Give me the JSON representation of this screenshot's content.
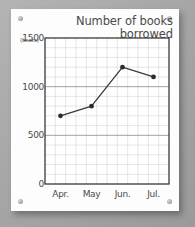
{
  "poster": {
    "corner_screws": [
      "screw-top-left",
      "screw-top-right",
      "screw-bottom-left",
      "screw-bottom-right"
    ]
  },
  "chart_data": {
    "type": "line",
    "title": "Number of books borrowed in Shool A",
    "title_line_1": "Number of books borrowed",
    "title_line_2": "in Shool A",
    "categories": [
      "Apr.",
      "May",
      "Jun.",
      "Jul."
    ],
    "values": [
      700,
      800,
      1200,
      1100
    ],
    "series": [
      {
        "name": "Books borrowed",
        "values": [
          700,
          800,
          1200,
          1100
        ]
      }
    ],
    "xlabel": "",
    "ylabel": "(books)",
    "y_unit": "(books)",
    "ylim": [
      0,
      1500
    ],
    "yticks": [
      0,
      500,
      1000,
      1500
    ],
    "ytick_labels": [
      "0",
      "500",
      "1000",
      "1500"
    ],
    "y_minor_step": 100,
    "x_minor_columns": 12,
    "grid": true,
    "legend": false,
    "line_color": "#3a3a3a",
    "marker": "circle",
    "marker_color": "#2b2b2b",
    "grid_major_color": "#8a8a8a",
    "grid_minor_color": "#d5d5d5",
    "axis_color": "#3a3a3a"
  }
}
